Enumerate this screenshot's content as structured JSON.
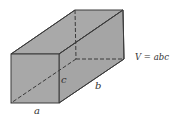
{
  "figure": {
    "type": "rectangular-prism-volume",
    "labels": {
      "a": "a",
      "b": "b",
      "c": "c",
      "formula": "V = abc"
    },
    "colors": {
      "face": "#a8a8a8",
      "edge": "#3a3a3a",
      "text": "#333333"
    }
  }
}
